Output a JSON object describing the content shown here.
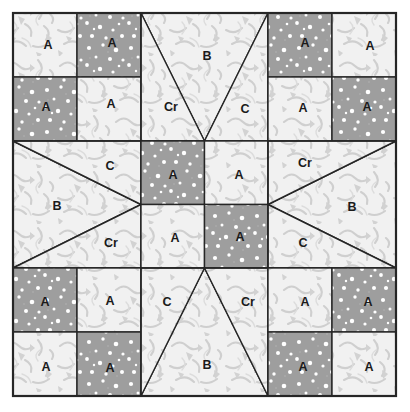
{
  "diagram": {
    "block": {
      "x": 13,
      "y": 13,
      "size": 383,
      "grid_lines": [
        141,
        268
      ]
    },
    "colors": {
      "dark_fabric": "#9e9e9e",
      "dark_fabric_dot": "#ffffff",
      "light_fabric": "#f0f0f0",
      "light_fabric_mark": "#cfcfcf",
      "outline": "#262626",
      "label_text": "#1a1a1a",
      "background": "#ffffff"
    },
    "legend_labels": {
      "a": "A",
      "b": "B",
      "c": "C",
      "cr": "Cr"
    },
    "units": [
      {
        "name": "top-left-four-patch",
        "type": "four-patch",
        "row": 0,
        "col": 0,
        "patches": [
          {
            "label": "A",
            "fabric": "light"
          },
          {
            "label": "A",
            "fabric": "dark"
          },
          {
            "label": "A",
            "fabric": "dark"
          },
          {
            "label": "A",
            "fabric": "light"
          }
        ]
      },
      {
        "name": "top-center-flying-geese",
        "type": "flying-geese",
        "row": 0,
        "col": 1,
        "orientation": "point-down",
        "patches": [
          {
            "label": "B",
            "fabric": "light",
            "role": "goose"
          },
          {
            "label": "Cr",
            "fabric": "light",
            "role": "left-wing"
          },
          {
            "label": "C",
            "fabric": "light",
            "role": "right-wing"
          }
        ]
      },
      {
        "name": "top-right-four-patch",
        "type": "four-patch",
        "row": 0,
        "col": 2,
        "patches": [
          {
            "label": "A",
            "fabric": "dark"
          },
          {
            "label": "A",
            "fabric": "light"
          },
          {
            "label": "A",
            "fabric": "light"
          },
          {
            "label": "A",
            "fabric": "dark"
          }
        ]
      },
      {
        "name": "middle-left-flying-geese",
        "type": "flying-geese",
        "row": 1,
        "col": 0,
        "orientation": "point-right",
        "patches": [
          {
            "label": "B",
            "fabric": "light",
            "role": "goose"
          },
          {
            "label": "C",
            "fabric": "light",
            "role": "top-wing"
          },
          {
            "label": "Cr",
            "fabric": "light",
            "role": "bottom-wing"
          }
        ]
      },
      {
        "name": "center-four-patch",
        "type": "four-patch",
        "row": 1,
        "col": 1,
        "patches": [
          {
            "label": "A",
            "fabric": "dark"
          },
          {
            "label": "A",
            "fabric": "light"
          },
          {
            "label": "A",
            "fabric": "light"
          },
          {
            "label": "A",
            "fabric": "dark"
          }
        ]
      },
      {
        "name": "middle-right-flying-geese",
        "type": "flying-geese",
        "row": 1,
        "col": 2,
        "orientation": "point-left",
        "patches": [
          {
            "label": "B",
            "fabric": "light",
            "role": "goose"
          },
          {
            "label": "Cr",
            "fabric": "light",
            "role": "top-wing"
          },
          {
            "label": "C",
            "fabric": "light",
            "role": "bottom-wing"
          }
        ]
      },
      {
        "name": "bottom-left-four-patch",
        "type": "four-patch",
        "row": 2,
        "col": 0,
        "patches": [
          {
            "label": "A",
            "fabric": "dark"
          },
          {
            "label": "A",
            "fabric": "light"
          },
          {
            "label": "A",
            "fabric": "light"
          },
          {
            "label": "A",
            "fabric": "dark"
          }
        ]
      },
      {
        "name": "bottom-center-flying-geese",
        "type": "flying-geese",
        "row": 2,
        "col": 1,
        "orientation": "point-up",
        "patches": [
          {
            "label": "B",
            "fabric": "light",
            "role": "goose"
          },
          {
            "label": "C",
            "fabric": "light",
            "role": "left-wing"
          },
          {
            "label": "Cr",
            "fabric": "light",
            "role": "right-wing"
          }
        ]
      },
      {
        "name": "bottom-right-four-patch",
        "type": "four-patch",
        "row": 2,
        "col": 2,
        "patches": [
          {
            "label": "A",
            "fabric": "light"
          },
          {
            "label": "A",
            "fabric": "dark"
          },
          {
            "label": "A",
            "fabric": "dark"
          },
          {
            "label": "A",
            "fabric": "light"
          }
        ]
      }
    ],
    "labels": [
      {
        "name": "label-a-tl-1",
        "text": "A",
        "x": 48,
        "y": 46
      },
      {
        "name": "label-a-tl-2",
        "text": "A",
        "x": 112,
        "y": 44
      },
      {
        "name": "label-a-tl-3",
        "text": "A",
        "x": 46,
        "y": 108
      },
      {
        "name": "label-a-tl-4",
        "text": "A",
        "x": 111,
        "y": 105
      },
      {
        "name": "label-b-top",
        "text": "B",
        "x": 207,
        "y": 57
      },
      {
        "name": "label-cr-top",
        "text": "Cr",
        "x": 171,
        "y": 108
      },
      {
        "name": "label-c-top",
        "text": "C",
        "x": 245,
        "y": 110
      },
      {
        "name": "label-a-tr-1",
        "text": "A",
        "x": 305,
        "y": 44
      },
      {
        "name": "label-a-tr-2",
        "text": "A",
        "x": 370,
        "y": 47
      },
      {
        "name": "label-a-tr-3",
        "text": "A",
        "x": 303,
        "y": 109
      },
      {
        "name": "label-a-tr-4",
        "text": "A",
        "x": 367,
        "y": 108
      },
      {
        "name": "label-c-left",
        "text": "C",
        "x": 110,
        "y": 167
      },
      {
        "name": "label-b-left",
        "text": "B",
        "x": 57,
        "y": 207
      },
      {
        "name": "label-cr-left",
        "text": "Cr",
        "x": 111,
        "y": 244
      },
      {
        "name": "label-a-c-1",
        "text": "A",
        "x": 173,
        "y": 176
      },
      {
        "name": "label-a-c-2",
        "text": "A",
        "x": 239,
        "y": 176
      },
      {
        "name": "label-a-c-3",
        "text": "A",
        "x": 175,
        "y": 239
      },
      {
        "name": "label-a-c-4",
        "text": "A",
        "x": 240,
        "y": 238
      },
      {
        "name": "label-cr-right",
        "text": "Cr",
        "x": 305,
        "y": 164
      },
      {
        "name": "label-b-right",
        "text": "B",
        "x": 352,
        "y": 208
      },
      {
        "name": "label-c-right",
        "text": "C",
        "x": 303,
        "y": 244
      },
      {
        "name": "label-a-bl-1",
        "text": "A",
        "x": 45,
        "y": 303
      },
      {
        "name": "label-a-bl-2",
        "text": "A",
        "x": 110,
        "y": 302
      },
      {
        "name": "label-a-bl-3",
        "text": "A",
        "x": 46,
        "y": 368
      },
      {
        "name": "label-a-bl-4",
        "text": "A",
        "x": 110,
        "y": 369
      },
      {
        "name": "label-c-bot",
        "text": "C",
        "x": 167,
        "y": 303
      },
      {
        "name": "label-cr-bot",
        "text": "Cr",
        "x": 248,
        "y": 303
      },
      {
        "name": "label-b-bot",
        "text": "B",
        "x": 207,
        "y": 366
      },
      {
        "name": "label-a-br-1",
        "text": "A",
        "x": 305,
        "y": 303
      },
      {
        "name": "label-a-br-2",
        "text": "A",
        "x": 368,
        "y": 303
      },
      {
        "name": "label-a-br-3",
        "text": "A",
        "x": 303,
        "y": 368
      },
      {
        "name": "label-a-br-4",
        "text": "A",
        "x": 369,
        "y": 368
      }
    ]
  }
}
